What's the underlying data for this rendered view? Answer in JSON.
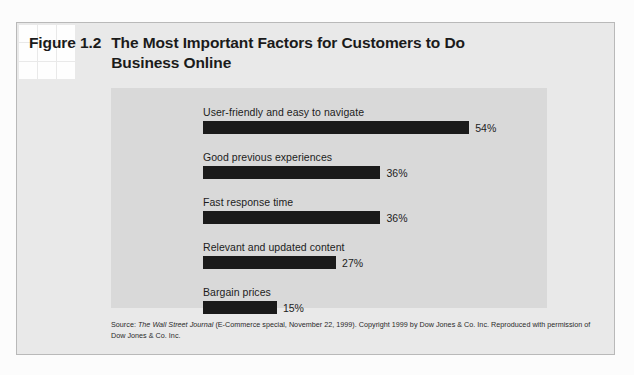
{
  "figure": {
    "number": "Figure 1.2",
    "title": "The Most Important Factors for Customers to Do Business Online"
  },
  "source": {
    "label": "Source: ",
    "publication": "The Wall Street Journal",
    "rest": " (E-Commerce special, November 22, 1999). Copyright 1999 by Dow Jones & Co. Inc. Reproduced with permission of Dow Jones & Co. Inc."
  },
  "colors": {
    "bar": "#1a1a1a",
    "panel_background": "#d9d9d9",
    "figure_background": "#e9e9e9",
    "text": "#1c1c1c"
  },
  "chart_data": {
    "type": "bar",
    "orientation": "horizontal",
    "title": "The Most Important Factors for Customers to Do Business Online",
    "xlabel": "",
    "ylabel": "",
    "xlim": [
      0,
      60
    ],
    "grid": false,
    "legend": null,
    "categories": [
      "User-friendly and easy to navigate",
      "Good previous experiences",
      "Fast response time",
      "Relevant and updated content",
      "Bargain prices"
    ],
    "values": [
      54,
      36,
      36,
      27,
      15
    ],
    "value_labels": [
      "54%",
      "36%",
      "36%",
      "27%",
      "15%"
    ],
    "units": "percent"
  }
}
